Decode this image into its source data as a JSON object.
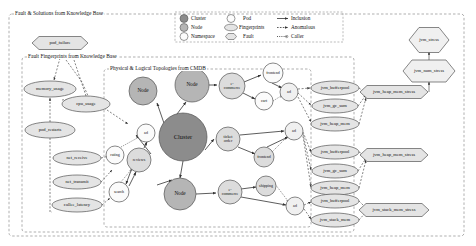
{
  "panels": {
    "fault_solutions": "Fault & Solutions from Knowledge Base",
    "fault_fingerprints": "Fault Fingerprints from Knowledge Base",
    "topologies": "Physical & Logical Topologies from CMDB"
  },
  "legend": {
    "items": [
      {
        "key": "cluster",
        "label": "Cluster",
        "shape": "circle-dark"
      },
      {
        "key": "node",
        "label": "Node",
        "shape": "circle-mid"
      },
      {
        "key": "namespace",
        "label": "Namespace",
        "shape": "circle-light"
      },
      {
        "key": "pod",
        "label": "Pod",
        "shape": "circle-white"
      },
      {
        "key": "fingerprints",
        "label": "Fingerprints",
        "shape": "ellipse"
      },
      {
        "key": "fault",
        "label": "Fault",
        "shape": "hexagon"
      },
      {
        "key": "inclusion",
        "label": "Inclusion",
        "shape": "arrow-solid"
      },
      {
        "key": "anomalous",
        "label": "Anomalous",
        "shape": "arrow-dashed"
      },
      {
        "key": "caller",
        "label": "Caller",
        "shape": "arrow-dotted-circle"
      }
    ]
  },
  "faults": [
    {
      "id": "pod_failure",
      "label": "pod_failure",
      "x": 60,
      "y": 43,
      "w": 56,
      "h": 13
    },
    {
      "id": "jvm_stress",
      "label": "jvm_stress",
      "x": 429,
      "y": 40,
      "w": 40,
      "h": 25
    },
    {
      "id": "jvm_num_stress",
      "label": "jvm_num_stress",
      "x": 429,
      "y": 71,
      "w": 52,
      "h": 22
    },
    {
      "id": "jvm_heap_mem_stress_1",
      "label": "jvm_heap_mem_stress",
      "x": 394,
      "y": 92,
      "w": 68,
      "h": 13
    },
    {
      "id": "jvm_heap_mem_stress_2",
      "label": "jvm_heap_mem_stress",
      "x": 394,
      "y": 155,
      "w": 68,
      "h": 13
    },
    {
      "id": "jvm_stack_mem_stress",
      "label": "jvm_stack_mem_stress",
      "x": 394,
      "y": 210,
      "w": 70,
      "h": 13
    }
  ],
  "fingerprints": [
    {
      "id": "memory_usage",
      "label": "memory_usage",
      "x": 50,
      "y": 89,
      "rx": 26,
      "ry": 8
    },
    {
      "id": "cpu_usage",
      "label": "cpu_usage",
      "x": 86,
      "y": 104,
      "rx": 24,
      "ry": 8
    },
    {
      "id": "pod_restarts",
      "label": "pod_restarts",
      "x": 50,
      "y": 130,
      "rx": 25,
      "ry": 8
    },
    {
      "id": "net_receive",
      "label": "net_receive",
      "x": 77,
      "y": 158,
      "rx": 24,
      "ry": 7
    },
    {
      "id": "net_transmit",
      "label": "net_transmit",
      "x": 77,
      "y": 182,
      "rx": 24,
      "ry": 7
    },
    {
      "id": "callee_latency",
      "label": "callee_latency",
      "x": 77,
      "y": 205,
      "rx": 25,
      "ry": 7
    },
    {
      "id": "jvm_bufferpool_1",
      "label": "jvm_bufferpool",
      "x": 335,
      "y": 88,
      "rx": 24,
      "ry": 7
    },
    {
      "id": "jvm_gc_sum_1",
      "label": "jvm_gc_sum",
      "x": 335,
      "y": 106,
      "rx": 23,
      "ry": 7
    },
    {
      "id": "jvm_heap_mem_1",
      "label": "jvm_heap_mem",
      "x": 335,
      "y": 124,
      "rx": 24,
      "ry": 7
    },
    {
      "id": "jvm_bufferpool_2",
      "label": "jvm_bufferpool",
      "x": 335,
      "y": 152,
      "rx": 24,
      "ry": 7
    },
    {
      "id": "jvm_gc_sum_2",
      "label": "jvm_gc_sum",
      "x": 335,
      "y": 171,
      "rx": 23,
      "ry": 7
    },
    {
      "id": "jvm_heap_mem_2",
      "label": "jvm_heap_mem",
      "x": 335,
      "y": 188,
      "rx": 24,
      "ry": 7
    },
    {
      "id": "jvm_bufferpool_3",
      "label": "jvm_bufferpool",
      "x": 335,
      "y": 201,
      "rx": 24,
      "ry": 7
    },
    {
      "id": "jvm_stack_mem_3",
      "label": "jvm_stack_mem",
      "x": 335,
      "y": 220,
      "rx": 24,
      "ry": 7
    }
  ],
  "topology_nodes": [
    {
      "id": "cluster",
      "label": "Cluster",
      "x": 183,
      "y": 137,
      "r": 24,
      "fill": "dark",
      "size": "big"
    },
    {
      "id": "node_top",
      "label": "Node",
      "x": 192,
      "y": 85,
      "r": 17,
      "fill": "mid",
      "size": "med"
    },
    {
      "id": "node_left",
      "label": "Node",
      "x": 143,
      "y": 91,
      "r": 14,
      "fill": "mid",
      "size": "med"
    },
    {
      "id": "node_bottom",
      "label": "Node",
      "x": 180,
      "y": 194,
      "r": 16,
      "fill": "mid",
      "size": "med"
    },
    {
      "id": "ecommerce_top",
      "label": "e-\ncommerce",
      "x": 232,
      "y": 86,
      "r": 13,
      "fill": "light",
      "size": "tiny"
    },
    {
      "id": "ticket_order",
      "label": "ticket\norder",
      "x": 228,
      "y": 139,
      "r": 12,
      "fill": "light",
      "size": "tiny"
    },
    {
      "id": "ecommerce_bottom",
      "label": "e-\ncommerce",
      "x": 230,
      "y": 192,
      "r": 12,
      "fill": "light",
      "size": "tiny"
    },
    {
      "id": "reviews",
      "label": "reviews",
      "x": 139,
      "y": 160,
      "r": 12,
      "fill": "light",
      "size": "tiny"
    },
    {
      "id": "rating",
      "label": "rating",
      "x": 115,
      "y": 155,
      "r": 9,
      "fill": "white",
      "size": "tiny"
    },
    {
      "id": "search",
      "label": "search",
      "x": 119,
      "y": 192,
      "r": 10,
      "fill": "white",
      "size": "tiny"
    },
    {
      "id": "ad_top_left",
      "label": "ad",
      "x": 146,
      "y": 133,
      "r": 9,
      "fill": "white",
      "size": "tiny"
    },
    {
      "id": "frontend_top",
      "label": "frontend",
      "x": 273,
      "y": 73,
      "r": 10,
      "fill": "white",
      "size": "tiny"
    },
    {
      "id": "cart",
      "label": "cart",
      "x": 264,
      "y": 101,
      "r": 9,
      "fill": "white",
      "size": "tiny"
    },
    {
      "id": "ad_top_right",
      "label": "ad",
      "x": 289,
      "y": 92,
      "r": 9,
      "fill": "white",
      "size": "tiny"
    },
    {
      "id": "frontend_mid",
      "label": "frontend",
      "x": 264,
      "y": 157,
      "r": 10,
      "fill": "white",
      "size": "tiny"
    },
    {
      "id": "ad_mid_right",
      "label": "ad",
      "x": 294,
      "y": 131,
      "r": 9,
      "fill": "white",
      "size": "tiny"
    },
    {
      "id": "shipping",
      "label": "shipping",
      "x": 266,
      "y": 186,
      "r": 10,
      "fill": "white",
      "size": "tiny"
    },
    {
      "id": "ad_bottom_right",
      "label": "ad",
      "x": 295,
      "y": 206,
      "r": 9,
      "fill": "white",
      "size": "tiny"
    }
  ],
  "colors": {
    "cluster_fill": "#8c8c8c",
    "node_fill": "#b5b5b5",
    "namespace_fill": "#dcdcdc",
    "pod_fill": "#f2f2f2",
    "shape_fill": "#e4e4e4",
    "stroke": "#555555",
    "panel_border": "#999999",
    "text": "#111111"
  }
}
